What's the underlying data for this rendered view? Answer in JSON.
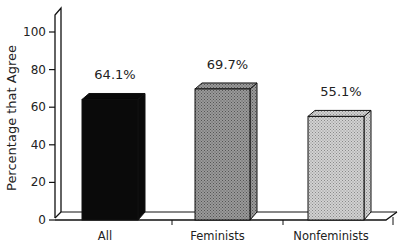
{
  "chart_data": {
    "type": "bar",
    "title": "",
    "xlabel": "",
    "ylabel": "Percentage that Agree",
    "ylim": [
      0,
      100
    ],
    "yticks": [
      0,
      20,
      40,
      60,
      80,
      100
    ],
    "categories": [
      "All",
      "Feminists",
      "Nonfeminists"
    ],
    "values": [
      64.1,
      69.7,
      55.1
    ],
    "value_labels": [
      "64.1%",
      "69.7%",
      "55.1%"
    ],
    "bar_fills": [
      "#0a0a0a",
      "#8a8a8a",
      "#c4c4c4"
    ],
    "style": "3d",
    "grid": false,
    "legend": null
  },
  "axis": {
    "ylabel": "Percentage that Agree",
    "ticks": [
      "0",
      "20",
      "40",
      "60",
      "80",
      "100"
    ]
  }
}
